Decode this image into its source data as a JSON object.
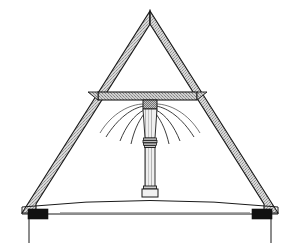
{
  "figure": {
    "title": "Hammer-beam / king-post roof truss cross-section",
    "width": 300,
    "height": 250,
    "background_color": "#ffffff",
    "line_color": "#1a1a1a",
    "timber_fill_color": "#b9b9b9",
    "solid_block_color": "#111111",
    "caption": ""
  },
  "geometry": {
    "apex": {
      "x": 150,
      "y": 11
    },
    "rafter_band_width": 13,
    "left_eave": {
      "x": 22,
      "y": 213
    },
    "right_eave": {
      "x": 278,
      "y": 213
    },
    "collar_beam": {
      "x1": 98,
      "x2": 197,
      "y_top": 92,
      "y_bottom": 100
    },
    "post": {
      "x": 150,
      "y_top": 100,
      "y_bottom": 196,
      "width": 11
    },
    "tie_beam_camber": {
      "left_y": 206,
      "center_y": 196,
      "right_y": 206
    },
    "lower_beam": {
      "y": 214
    },
    "wall_plate_left": {
      "x": 26,
      "y": 210,
      "w": 20,
      "h": 10
    },
    "wall_plate_right": {
      "x": 254,
      "y": 210,
      "w": 20,
      "h": 10
    },
    "drop_left_x": 26,
    "drop_right_x": 274,
    "drop_bottom_y": 243
  },
  "parts": [
    {
      "id": "left-rafter",
      "label": "Left principal rafter",
      "style": "stippled timber band"
    },
    {
      "id": "right-rafter",
      "label": "Right principal rafter",
      "style": "stippled timber band"
    },
    {
      "id": "collar-beam",
      "label": "Collar beam",
      "style": "stippled timber band"
    },
    {
      "id": "king-post",
      "label": "King post / central column",
      "style": "outlined shaft with mouldings"
    },
    {
      "id": "post-capital",
      "label": "Column capital",
      "style": "cross-hatched block"
    },
    {
      "id": "post-base",
      "label": "Column base plinth",
      "style": "small outlined block"
    },
    {
      "id": "brace-fan-left",
      "label": "Left curved brace fan",
      "style": "thin curved ribs"
    },
    {
      "id": "brace-fan-right",
      "label": "Right curved brace fan",
      "style": "thin curved ribs"
    },
    {
      "id": "tie-beam",
      "label": "Cambered tie beam",
      "style": "thin double line"
    },
    {
      "id": "wall-plate-left",
      "label": "Left wall plate",
      "style": "solid black block"
    },
    {
      "id": "wall-plate-right",
      "label": "Right wall plate",
      "style": "solid black block"
    },
    {
      "id": "wall-line-left",
      "label": "Left wall face line",
      "style": "thin vertical line"
    },
    {
      "id": "wall-line-right",
      "label": "Right wall face line",
      "style": "thin vertical line"
    }
  ],
  "annotations": {
    "labels": [],
    "dimensions": [],
    "scale_bar": ""
  }
}
